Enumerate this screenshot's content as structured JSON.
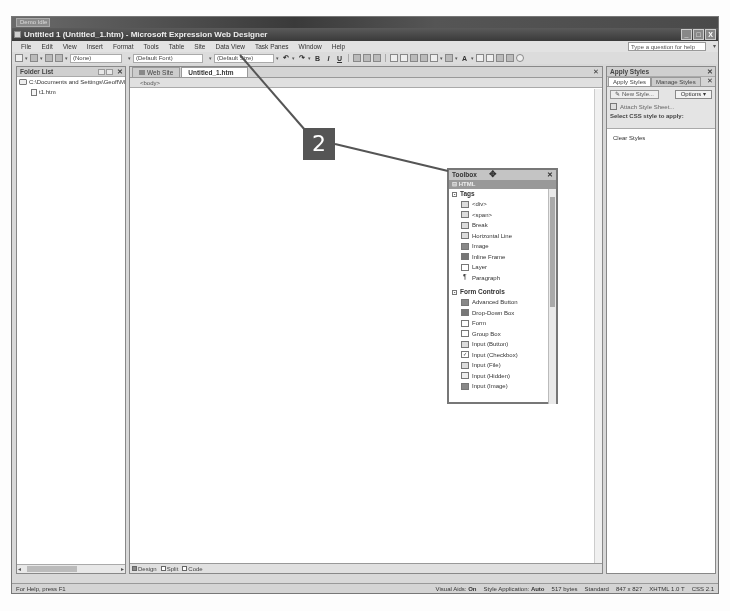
{
  "taskbar": {
    "label": "Demo Idle"
  },
  "window": {
    "title": "Untitled 1 (Untitled_1.htm) - Microsoft Expression Web Designer",
    "controls": [
      "_",
      "□",
      "X"
    ]
  },
  "menu": {
    "items": [
      "File",
      "Edit",
      "View",
      "Insert",
      "Format",
      "Tools",
      "Table",
      "Site",
      "Data View",
      "Task Panes",
      "Window",
      "Help"
    ],
    "help_placeholder": "Type a question for help"
  },
  "toolbar": {
    "style_select": "(None)",
    "font_select": "(Default Font)",
    "size_select": "(Default Size)",
    "bold": "B",
    "italic": "I",
    "underline": "U"
  },
  "folder_list": {
    "title": "Folder List",
    "root": "C:\\Documents and Settings\\Geoff\\M",
    "files": [
      "t1.htm"
    ]
  },
  "editor": {
    "tabs": [
      {
        "label": "Web Site",
        "active": false
      },
      {
        "label": "Untitled_1.htm",
        "active": true
      }
    ],
    "tag_bar": "<body>",
    "views": [
      "Design",
      "Split",
      "Code"
    ]
  },
  "apply_styles": {
    "title": "Apply Styles",
    "tabs": [
      "Apply Styles",
      "Manage Styles"
    ],
    "new_style": "New Style...",
    "options": "Options ▾",
    "attach": "Attach Style Sheet...",
    "select_label": "Select CSS style to apply:",
    "styles": [
      "Clear Styles"
    ]
  },
  "toolbox": {
    "title": "Toolbox",
    "category": "HTML",
    "groups": [
      {
        "name": "Tags",
        "items": [
          "<div>",
          "<span>",
          "Break",
          "Horizontal Line",
          "Image",
          "Inline Frame",
          "Layer",
          "Paragraph"
        ]
      },
      {
        "name": "Form Controls",
        "items": [
          "Advanced Button",
          "Drop-Down Box",
          "Form",
          "Group Box",
          "Input (Button)",
          "Input (Checkbox)",
          "Input (File)",
          "Input (Hidden)",
          "Input (Image)"
        ]
      }
    ]
  },
  "callout": {
    "number": "2"
  },
  "status": {
    "left": "For Help, press F1",
    "visual_aids_label": "Visual Aids:",
    "visual_aids_value": "On",
    "style_app_label": "Style Application:",
    "style_app_value": "Auto",
    "size": "517 bytes",
    "mode": "Standard",
    "dimensions": "847 x 827",
    "doctype": "XHTML 1.0 T",
    "css": "CSS 2.1"
  }
}
